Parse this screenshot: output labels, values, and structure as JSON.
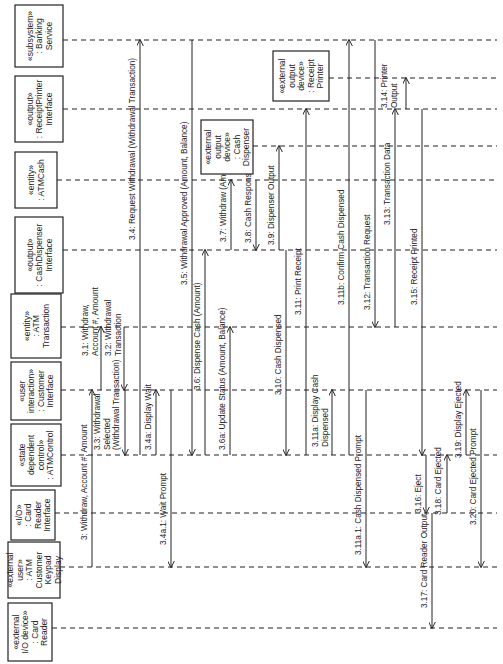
{
  "diagram": {
    "type": "UML sequence diagram",
    "orientation": "rotated 90 degrees counter-clockwise",
    "objects": [
      {
        "id": "bank",
        "lines": [
          "«subsystem»",
          ": Banking",
          "Service"
        ],
        "y": 40,
        "box": {
          "x": 15,
          "y": 5,
          "w": 48,
          "h": 62
        }
      },
      {
        "id": "rpi",
        "lines": [
          "«output»",
          ": ReceiptPrinter",
          "Interface"
        ],
        "y": 109,
        "box": {
          "x": 15,
          "y": 76,
          "w": 48,
          "h": 66
        }
      },
      {
        "id": "cash",
        "lines": [
          "«entity»",
          ": ATMCash"
        ],
        "y": 180,
        "box": {
          "x": 15,
          "y": 152,
          "w": 42,
          "h": 56
        }
      },
      {
        "id": "cdi",
        "lines": [
          "«output»",
          ": CashDispenser",
          "Interface"
        ],
        "y": 250,
        "box": {
          "x": 15,
          "y": 217,
          "w": 48,
          "h": 76
        }
      },
      {
        "id": "trans",
        "lines": [
          "«entity»",
          ": ATM",
          "Transaction"
        ],
        "y": 327,
        "box": {
          "x": 11,
          "y": 294,
          "w": 50,
          "h": 64
        }
      },
      {
        "id": "ci",
        "lines": [
          "«user",
          "interaction»",
          ": Customer",
          "Interface"
        ],
        "y": 390,
        "box": {
          "x": 11,
          "y": 362,
          "w": 50,
          "h": 58
        }
      },
      {
        "id": "ctrl",
        "lines": [
          "«state",
          "dependent",
          "control»",
          ": ATMControl"
        ],
        "y": 455,
        "box": {
          "x": 11,
          "y": 424,
          "w": 50,
          "h": 62
        }
      },
      {
        "id": "cri",
        "lines": [
          "«I/O»",
          ": Card",
          "Reader",
          "Interface"
        ],
        "y": 513,
        "box": {
          "x": 11,
          "y": 490,
          "w": 44,
          "h": 50
        }
      },
      {
        "id": "keypad",
        "lines": [
          "«external",
          "user»",
          ": ATM",
          "Customer",
          "Keypad",
          "Display"
        ],
        "y": 567,
        "box": {
          "x": 8,
          "y": 542,
          "w": 52,
          "h": 56
        }
      },
      {
        "id": "reader",
        "lines": [
          "«external",
          "I/O device»",
          ": Card",
          "Reader"
        ],
        "y": 628,
        "box": {
          "x": 8,
          "y": 603,
          "w": 44,
          "h": 58
        }
      },
      {
        "id": "printer",
        "lines": [
          "«external",
          "output",
          "device»",
          ": Receipt",
          "Printer"
        ],
        "y": 78,
        "box": {
          "x": 273,
          "y": 51,
          "w": 56,
          "h": 50
        }
      },
      {
        "id": "dispenser",
        "lines": [
          "«external",
          "output",
          "device»",
          ": Cash",
          "Dispenser"
        ],
        "y": 146,
        "box": {
          "x": 201,
          "y": 120,
          "w": 52,
          "h": 54
        }
      }
    ],
    "messages": [
      {
        "label": "3: Withdraw, Account #, Amount",
        "x": 92,
        "from": 567,
        "to": 390,
        "label_pos": {
          "x": 87,
          "y": 540
        }
      },
      {
        "label": "3.1: Withdraw, Account #, Amount",
        "x": 101,
        "from": 390,
        "to": 327,
        "label_pos": {
          "x": 88,
          "y": 356
        },
        "lines": [
          "3.1: Withdraw,",
          "Account #, Amount"
        ]
      },
      {
        "label": "3.2: Withdrawal Transaction",
        "x": 124,
        "from": 327,
        "to": 390,
        "label_pos": {
          "x": 111,
          "y": 356
        },
        "lines": [
          "3.2: Withdrawal",
          "Transaction"
        ]
      },
      {
        "label": "3.3: Withdrawal Selected (Withdrawal Transaction)",
        "x": 125,
        "from": 390,
        "to": 455,
        "label_pos": {
          "x": 100,
          "y": 450
        },
        "lines": [
          "3.3: Withdrawal",
          "Selected",
          "(Withdrawal Transaction)"
        ]
      },
      {
        "label": "3.4: Request Withdrawal (Withdrawal Transaction)",
        "x": 140,
        "from": 455,
        "to": 40,
        "label_pos": {
          "x": 135,
          "y": 240
        }
      },
      {
        "label": "3.4a: Display Wait",
        "x": 156,
        "from": 455,
        "to": 390,
        "label_pos": {
          "x": 151,
          "y": 450
        }
      },
      {
        "label": "3.4a.1: Wait Prompt",
        "x": 171,
        "from": 390,
        "to": 567,
        "label_pos": {
          "x": 166,
          "y": 545
        }
      },
      {
        "label": "3.5: Withdrawal Approved (Amount, Balance)",
        "x": 192,
        "from": 40,
        "to": 455,
        "label_pos": {
          "x": 187,
          "y": 285
        }
      },
      {
        "label": "3.6: Dispense Cash (Amount)",
        "x": 205,
        "from": 455,
        "to": 250,
        "label_pos": {
          "x": 200,
          "y": 390
        }
      },
      {
        "label": "3.6a: Update Status (Amount, Balance)",
        "x": 230,
        "from": 455,
        "to": 327,
        "label_pos": {
          "x": 225,
          "y": 450
        }
      },
      {
        "label": "3.7: Withdraw (Amount)",
        "x": 231,
        "from": 250,
        "to": 180,
        "label_pos": {
          "x": 226,
          "y": 242
        }
      },
      {
        "label": "3.8: Cash Response",
        "x": 256,
        "from": 180,
        "to": 250,
        "label_pos": {
          "x": 251,
          "y": 243
        }
      },
      {
        "label": "3.9: Dispenser Output",
        "x": 279,
        "from": 250,
        "to": 146,
        "label_pos": {
          "x": 274,
          "y": 245
        }
      },
      {
        "label": "3.10: Cash Dispensed",
        "x": 286,
        "from": 250,
        "to": 455,
        "label_pos": {
          "x": 281,
          "y": 395
        }
      },
      {
        "label": "3.11: Print Receipt",
        "x": 306,
        "from": 455,
        "to": 109,
        "label_pos": {
          "x": 301,
          "y": 315
        }
      },
      {
        "label": "3.11a: Display Cash Dispensed",
        "x": 332,
        "from": 455,
        "to": 390,
        "label_pos": {
          "x": 318,
          "y": 447
        },
        "lines": [
          "3.11a: Display Cash",
          "Dispensed"
        ]
      },
      {
        "label": "3.11a.1: Cash Dispensed Prompt",
        "x": 366,
        "from": 390,
        "to": 567,
        "label_pos": {
          "x": 361,
          "y": 555
        }
      },
      {
        "label": "3.11b: Confirm Cash Dispensed",
        "x": 349,
        "from": 455,
        "to": 40,
        "label_pos": {
          "x": 344,
          "y": 305
        }
      },
      {
        "label": "3.12: Transaction Request",
        "x": 375,
        "from": 40,
        "to": 327,
        "label_pos": {
          "x": 370,
          "y": 310
        }
      },
      {
        "label": "3.13: Transaction Data",
        "x": 395,
        "from": 327,
        "to": 109,
        "label_pos": {
          "x": 390,
          "y": 225
        }
      },
      {
        "label": "3.14: Printer Output",
        "x": 406,
        "from": 109,
        "to": 78,
        "label_pos": {
          "x": 387,
          "y": 108
        },
        "lines": [
          "3.14: Printer",
          "Output"
        ]
      },
      {
        "label": "3.15: Receipt Printed",
        "x": 422,
        "from": 109,
        "to": 455,
        "label_pos": {
          "x": 417,
          "y": 305
        }
      },
      {
        "label": "3.16: Eject",
        "x": 426,
        "from": 455,
        "to": 513,
        "label_pos": {
          "x": 421,
          "y": 513
        }
      },
      {
        "label": "3.17: Card Reader Output",
        "x": 432,
        "from": 513,
        "to": 628,
        "label_pos": {
          "x": 427,
          "y": 608
        }
      },
      {
        "label": "3.18: Card Ejected",
        "x": 447,
        "from": 513,
        "to": 455,
        "label_pos": {
          "x": 441,
          "y": 515
        }
      },
      {
        "label": "3.19: Display Ejected",
        "x": 466,
        "from": 455,
        "to": 390,
        "label_pos": {
          "x": 461,
          "y": 458
        }
      },
      {
        "label": "3.20: Card Ejected Prompt",
        "x": 481,
        "from": 390,
        "to": 567,
        "label_pos": {
          "x": 476,
          "y": 525
        }
      }
    ]
  }
}
